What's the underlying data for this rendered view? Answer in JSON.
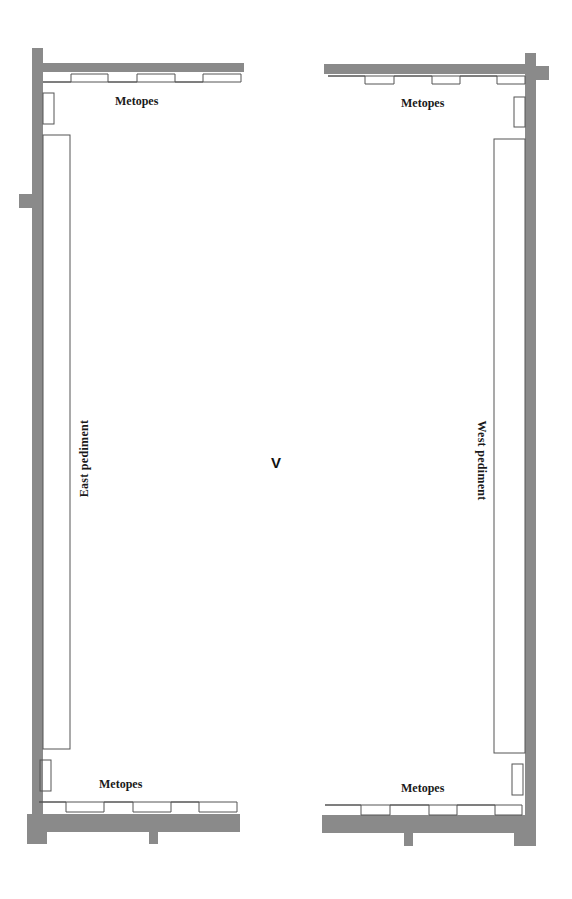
{
  "diagram": {
    "room_label": "V",
    "labels": {
      "metopes_top_left": "Metopes",
      "metopes_top_right": "Metopes",
      "metopes_bottom_left": "Metopes",
      "metopes_bottom_right": "Metopes",
      "east_pediment": "East pediment",
      "west_pediment": "West pediment"
    },
    "colors": {
      "wall": "#8a8a8a",
      "outline": "#555555",
      "background": "#ffffff"
    }
  }
}
